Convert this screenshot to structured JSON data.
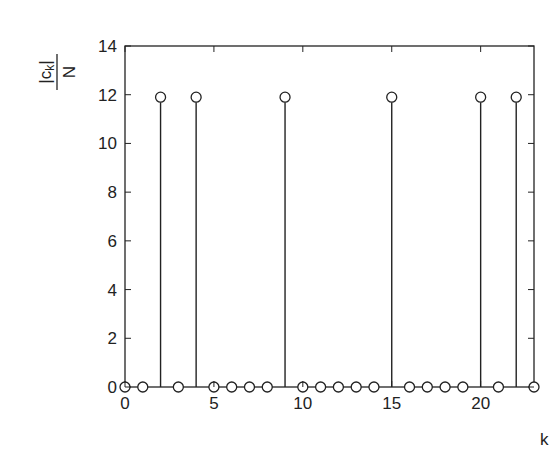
{
  "chart_data": {
    "type": "stem",
    "title": "",
    "xlabel": "k",
    "ylabel": "|c_k| / N",
    "ylabel_parts": {
      "numerator": "|c",
      "subscript": "k",
      "numerator_close": "|",
      "denominator": "N"
    },
    "xlim": [
      0,
      23
    ],
    "ylim": [
      0,
      14
    ],
    "xticks": [
      0,
      5,
      10,
      15,
      20
    ],
    "yticks": [
      0,
      2,
      4,
      6,
      8,
      10,
      12,
      14
    ],
    "grid": false,
    "legend": null,
    "marker": "circle-open",
    "x": [
      0,
      1,
      2,
      3,
      4,
      5,
      6,
      7,
      8,
      9,
      10,
      11,
      12,
      13,
      14,
      15,
      16,
      17,
      18,
      19,
      20,
      21,
      22,
      23
    ],
    "values": [
      0,
      0,
      11.9,
      0,
      11.9,
      0,
      0,
      0,
      0,
      11.9,
      0,
      0,
      0,
      0,
      0,
      11.9,
      0,
      0,
      0,
      0,
      11.9,
      0,
      11.9,
      0
    ]
  },
  "colors": {
    "line": "#222222",
    "background": "#ffffff"
  }
}
